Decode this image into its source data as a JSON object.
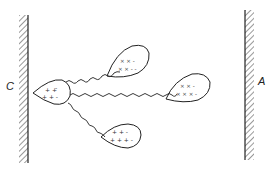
{
  "diagram": {
    "left_electrode": {
      "label": "C"
    },
    "right_electrode": {
      "label": "A"
    },
    "central_particle": {
      "charges": "+ + + + -",
      "position": "attached to C"
    },
    "particles": [
      {
        "id": "upper",
        "charges": "× × × - - -"
      },
      {
        "id": "middle-right",
        "charges": "× × × - - -"
      },
      {
        "id": "lower",
        "charges": "+ + + - - -"
      }
    ],
    "colors": {
      "stroke": "#222222",
      "background": "#ffffff"
    }
  }
}
